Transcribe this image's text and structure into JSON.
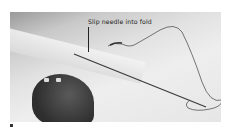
{
  "photo": {
    "subject": "needle-and-thread-sewing-fold",
    "annotation": "Slip needle into fold"
  },
  "colors": {
    "background": "#ffffff",
    "photo_light": "#e6e6e6",
    "photo_dark": "#2e2e2e",
    "text": "#222222"
  }
}
